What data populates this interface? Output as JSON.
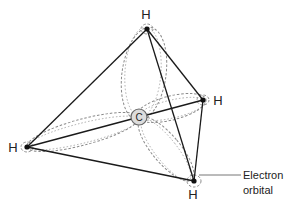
{
  "diagram": {
    "central_atom": {
      "label": "C",
      "x": 139,
      "y": 117
    },
    "hydrogens": [
      {
        "id": "top",
        "label": "H",
        "x": 147,
        "y": 29,
        "label_x": 146,
        "label_y": 19
      },
      {
        "id": "right",
        "label": "H",
        "x": 203,
        "y": 100,
        "label_x": 218,
        "label_y": 105
      },
      {
        "id": "left",
        "label": "H",
        "x": 27,
        "y": 147,
        "label_x": 13,
        "label_y": 152
      },
      {
        "id": "bottom",
        "label": "H",
        "x": 194,
        "y": 181,
        "label_x": 193,
        "label_y": 199
      }
    ],
    "callout": {
      "line1": "Electron",
      "line2": "orbital"
    },
    "colors": {
      "bond": "#1a1a1a",
      "orbital": "#8a8a8a",
      "carbon_fill": "#dcdcdc",
      "text": "#222222"
    }
  }
}
